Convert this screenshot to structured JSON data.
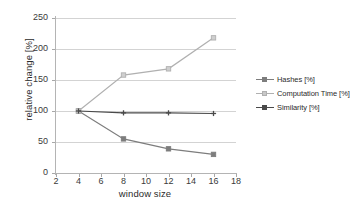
{
  "chart_data": {
    "type": "line",
    "title": "",
    "xlabel": "window size",
    "ylabel": "relative change [%]",
    "xlim": [
      2,
      18
    ],
    "ylim": [
      0,
      250
    ],
    "x": [
      4,
      8,
      12,
      16
    ],
    "xticks": [
      2,
      4,
      6,
      8,
      10,
      12,
      14,
      16,
      18
    ],
    "yticks": [
      0,
      50,
      100,
      150,
      200,
      250
    ],
    "grid": true,
    "legend_position": "right",
    "series": [
      {
        "name": "Hashes [%]",
        "values": [
          100,
          55,
          39,
          30
        ],
        "color": "#7d7d7d",
        "marker": "square"
      },
      {
        "name": "Computation Time [%]",
        "values": [
          100,
          158,
          168,
          218
        ],
        "color": "#b0b0b0",
        "marker": "square"
      },
      {
        "name": "Similarity [%]",
        "values": [
          100,
          97,
          97,
          96
        ],
        "color": "#4a4a4a",
        "marker": "plus"
      }
    ]
  },
  "axes": {
    "y_title": "relative change [%]",
    "x_title": "window size",
    "y_tick_labels": [
      "0",
      "50",
      "100",
      "150",
      "200",
      "250"
    ],
    "x_tick_labels": [
      "2",
      "4",
      "6",
      "8",
      "10",
      "12",
      "14",
      "16",
      "18"
    ]
  },
  "legend": {
    "entries": [
      {
        "label": "Hashes [%]"
      },
      {
        "label": "Computation Time [%]"
      },
      {
        "label": "Similarity [%]"
      }
    ]
  },
  "colors": {
    "hashes": "#7d7d7d",
    "computation_time": "#b0b0b0",
    "similarity": "#4a4a4a",
    "grid": "#d3d3d3",
    "axis": "#b4b4b4",
    "text": "#2b2b2b",
    "background": "#ffffff"
  }
}
